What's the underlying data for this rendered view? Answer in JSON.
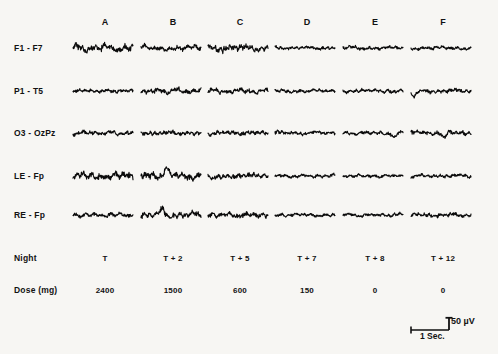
{
  "figure": {
    "type": "eeg-polygraph",
    "background_color": "#f7f6f3",
    "trace_color": "#0b0b0b",
    "columns": [
      {
        "id": "A",
        "label": "A",
        "x": 105,
        "night": "T",
        "dose": "2400"
      },
      {
        "id": "B",
        "label": "B",
        "x": 173,
        "night": "T + 2",
        "dose": "1500"
      },
      {
        "id": "C",
        "label": "C",
        "x": 240,
        "night": "T + 5",
        "dose": "600"
      },
      {
        "id": "D",
        "label": "D",
        "x": 307,
        "night": "T + 7",
        "dose": "150"
      },
      {
        "id": "E",
        "label": "E",
        "x": 375,
        "night": "T + 8",
        "dose": "0"
      },
      {
        "id": "F",
        "label": "F",
        "x": 443,
        "night": "T + 12",
        "dose": "0"
      }
    ],
    "channels": [
      {
        "id": "f1-f7",
        "label": "F1 - F7",
        "y": 48
      },
      {
        "id": "p1-t5",
        "label": "P1 - T5",
        "y": 91
      },
      {
        "id": "o3-ozpz",
        "label": "O3 - OzPz",
        "y": 133
      },
      {
        "id": "le-fp",
        "label": "LE - Fp",
        "y": 176
      },
      {
        "id": "re-fp",
        "label": "RE - Fp",
        "y": 215
      }
    ],
    "annotation_rows": [
      {
        "id": "night",
        "label": "Night",
        "y": 258
      },
      {
        "id": "dose",
        "label": "Dose (mg)",
        "y": 290
      }
    ],
    "scalebar": {
      "amplitude_label": "50  µV",
      "time_label": "1 Sec.",
      "amplitude_value": 50,
      "amplitude_unit": "µV",
      "time_value": 1,
      "time_unit": "Sec."
    },
    "page_bleed_text": " "
  },
  "chart_data": {
    "type": "line",
    "title": "",
    "xlabel": "",
    "ylabel": "",
    "categories": [
      "A",
      "B",
      "C",
      "D",
      "E",
      "F"
    ],
    "series": [
      {
        "name": "F1 - F7",
        "amplitude": [
          9.5,
          7.0,
          8.5,
          4.0,
          4.5,
          4.0
        ]
      },
      {
        "name": "P1 - T5",
        "amplitude": [
          4.0,
          6.5,
          6.0,
          4.0,
          4.5,
          5.0
        ]
      },
      {
        "name": "O3 - OzPz",
        "amplitude": [
          5.5,
          5.5,
          5.0,
          4.5,
          4.5,
          5.5
        ]
      },
      {
        "name": "LE - Fp",
        "amplitude": [
          9.0,
          9.5,
          6.0,
          4.0,
          3.5,
          4.5
        ]
      },
      {
        "name": "RE - Fp",
        "amplitude": [
          5.0,
          7.5,
          6.5,
          4.0,
          4.0,
          5.0
        ]
      }
    ],
    "x_axis_annotations": {
      "Night": [
        "T",
        "T + 2",
        "T + 5",
        "T + 7",
        "T + 8",
        "T + 12"
      ],
      "Dose (mg)": [
        2400,
        1500,
        600,
        150,
        0,
        0
      ]
    },
    "calibration": {
      "amplitude": "50 µV",
      "time": "1 Sec."
    },
    "grid": false,
    "legend": "none"
  }
}
